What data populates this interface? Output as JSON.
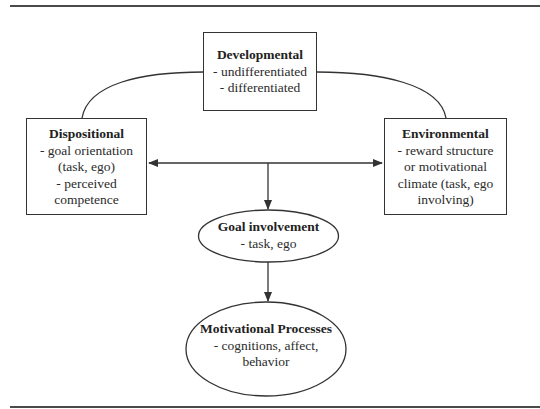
{
  "diagram": {
    "type": "conceptual-model",
    "nodes": {
      "developmental": {
        "shape": "rectangle",
        "title": "Developmental",
        "lines": [
          "- undifferentiated",
          "- differentiated"
        ]
      },
      "dispositional": {
        "shape": "rectangle",
        "title": "Dispositional",
        "lines": [
          "- goal orientation",
          "(task, ego)",
          "- perceived",
          "competence"
        ]
      },
      "environmental": {
        "shape": "rectangle",
        "title": "Environmental",
        "lines": [
          "- reward structure",
          "or motivational",
          "climate (task, ego",
          "involving)"
        ]
      },
      "goal_involvement": {
        "shape": "ellipse",
        "title": "Goal involvement",
        "lines": [
          "- task, ego"
        ]
      },
      "motivational_processes": {
        "shape": "ellipse",
        "title": "Motivational Processes",
        "lines": [
          "- cognitions, affect,",
          "behavior"
        ]
      }
    },
    "edges": [
      {
        "from": "developmental",
        "to": "dispositional",
        "style": "curved-line",
        "arrow": "none"
      },
      {
        "from": "developmental",
        "to": "environmental",
        "style": "curved-line",
        "arrow": "none"
      },
      {
        "from": "dispositional",
        "to": "environmental",
        "style": "straight",
        "arrow": "both"
      },
      {
        "from": "dispositional-environmental-link",
        "to": "goal_involvement",
        "style": "straight",
        "arrow": "end"
      },
      {
        "from": "goal_involvement",
        "to": "motivational_processes",
        "style": "straight",
        "arrow": "end"
      }
    ],
    "colors": {
      "stroke": "#333333",
      "text": "#2b2b2b",
      "background": "#ffffff",
      "rule": "#4a4a4a"
    }
  }
}
